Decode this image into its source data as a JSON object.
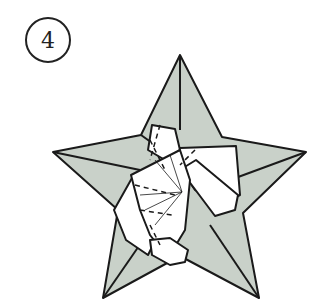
{
  "diagram": {
    "step_number": "4",
    "colors": {
      "paper_back": "#c9d1c9",
      "paper_front": "#ffffff",
      "line": "#1a1a1a"
    }
  }
}
